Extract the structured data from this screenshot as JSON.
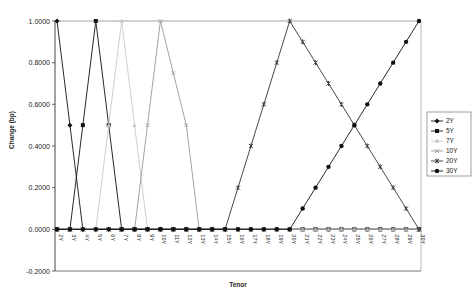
{
  "chart_data": {
    "type": "line",
    "title": "",
    "xlabel": "Tenor",
    "ylabel": "Change (bp)",
    "ylim": [
      -0.2,
      1.0
    ],
    "yticks": [
      "1.0000",
      "0.8000",
      "0.6000",
      "0.4000",
      "0.2000",
      "0.0000",
      "-0.2000"
    ],
    "categories": [
      "2Y",
      "3Y",
      "4Y",
      "5Y",
      "6Y",
      "7Y",
      "8Y",
      "9Y",
      "10Y",
      "11Y",
      "12Y",
      "13Y",
      "14Y",
      "15Y",
      "16Y",
      "17Y",
      "18Y",
      "19Y",
      "20Y",
      "21Y",
      "22Y",
      "23Y",
      "24Y",
      "25Y",
      "26Y",
      "27Y",
      "28Y",
      "29Y",
      "30Y"
    ],
    "legend_position": "right",
    "grid": false,
    "series": [
      {
        "name": "2Y",
        "color": "#111111",
        "marker": "diamond",
        "values": [
          1,
          0.5,
          0,
          0,
          0,
          0,
          0,
          0,
          0,
          0,
          0,
          0,
          0,
          0,
          0,
          0,
          0,
          0,
          0,
          0,
          0,
          0,
          0,
          0,
          0,
          0,
          0,
          0,
          0
        ]
      },
      {
        "name": "5Y",
        "color": "#111111",
        "marker": "square",
        "values": [
          0,
          0,
          0.5,
          1,
          0.5,
          0,
          0,
          0,
          0,
          0,
          0,
          0,
          0,
          0,
          0,
          0,
          0,
          0,
          0,
          0,
          0,
          0,
          0,
          0,
          0,
          0,
          0,
          0,
          0
        ]
      },
      {
        "name": "7Y",
        "color": "#c8c8c8",
        "marker": "triangle",
        "values": [
          0,
          0,
          0,
          0,
          0.5,
          1,
          0.5,
          0,
          0,
          0,
          0,
          0,
          0,
          0,
          0,
          0,
          0,
          0,
          0,
          0,
          0,
          0,
          0,
          0,
          0,
          0,
          0,
          0,
          0
        ]
      },
      {
        "name": "10Y",
        "color": "#999999",
        "marker": "x",
        "values": [
          0,
          0,
          0,
          0,
          0,
          0,
          0,
          0.5,
          1,
          0.75,
          0.5,
          0,
          0,
          0,
          0,
          0,
          0,
          0,
          0,
          0,
          0,
          0,
          0,
          0,
          0,
          0,
          0,
          0,
          0
        ]
      },
      {
        "name": "20Y",
        "color": "#333333",
        "marker": "star",
        "values": [
          0,
          0,
          0,
          0,
          0,
          0,
          0,
          0,
          0,
          0,
          0,
          0,
          0,
          0,
          0.2,
          0.4,
          0.6,
          0.8,
          1.0,
          0.9,
          0.8,
          0.7,
          0.6,
          0.5,
          0.4,
          0.3,
          0.2,
          0.1,
          0
        ]
      },
      {
        "name": "30Y",
        "color": "#111111",
        "marker": "circle",
        "values": [
          0,
          0,
          0,
          0,
          0,
          0,
          0,
          0,
          0,
          0,
          0,
          0,
          0,
          0,
          0,
          0,
          0,
          0,
          0,
          0.1,
          0.2,
          0.3,
          0.4,
          0.5,
          0.6,
          0.7,
          0.8,
          0.9,
          1.0
        ]
      }
    ]
  }
}
